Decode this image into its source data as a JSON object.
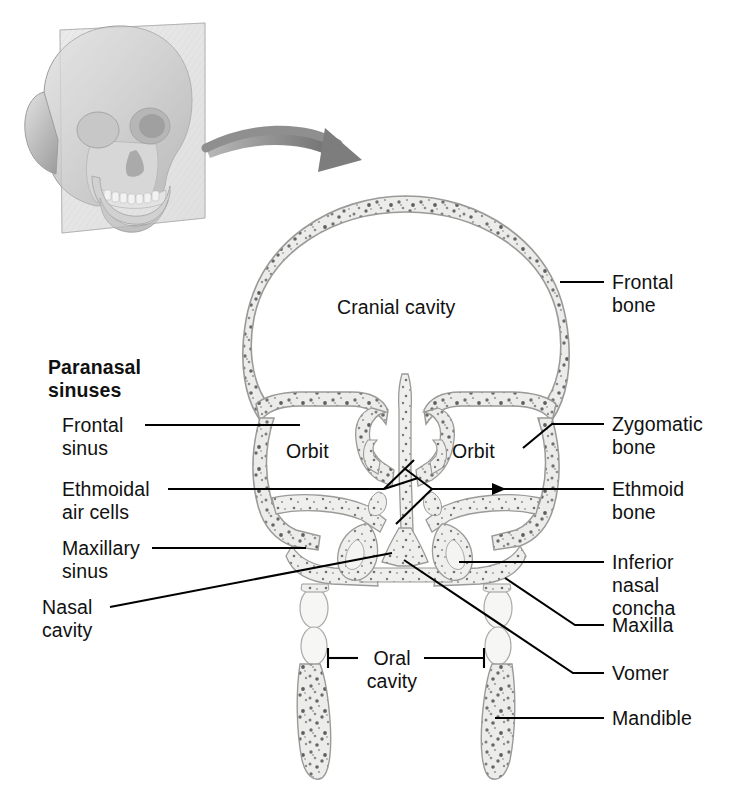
{
  "figure": {
    "type": "anatomical-illustration",
    "orientation": "anterior view of coronal section"
  },
  "inset": {
    "name": "skull-3d-inset",
    "description": "Three-quarter view of a human skull with a transparent coronal sectioning plane",
    "plane_label": "",
    "arrow": "curved-arrow pointing from inset to main section"
  },
  "left_labels": {
    "group_heading": "Paranasal\nsinuses",
    "items": [
      {
        "id": "frontal-sinus",
        "text": "Frontal\nsinus",
        "indent": true
      },
      {
        "id": "ethmoidal-air-cells",
        "text": "Ethmoidal\nair cells",
        "indent": true
      },
      {
        "id": "maxillary-sinus",
        "text": "Maxillary\nsinus",
        "indent": true
      },
      {
        "id": "nasal-cavity",
        "text": "Nasal\ncavity",
        "indent": false
      }
    ]
  },
  "right_labels": {
    "items": [
      {
        "id": "frontal-bone",
        "text": "Frontal\nbone"
      },
      {
        "id": "zygomatic-bone",
        "text": "Zygomatic\nbone"
      },
      {
        "id": "ethmoid-bone",
        "text": "Ethmoid\nbone"
      },
      {
        "id": "inferior-nasal-concha",
        "text": "Inferior\nnasal\nconcha"
      },
      {
        "id": "maxilla",
        "text": "Maxilla"
      },
      {
        "id": "vomer",
        "text": "Vomer"
      },
      {
        "id": "mandible",
        "text": "Mandible"
      }
    ]
  },
  "interior_labels": {
    "items": [
      {
        "id": "cranial-cavity",
        "text": "Cranial cavity"
      },
      {
        "id": "orbit-left",
        "text": "Orbit"
      },
      {
        "id": "orbit-right",
        "text": "Orbit"
      },
      {
        "id": "oral-cavity",
        "text": "Oral\ncavity"
      }
    ]
  },
  "colors": {
    "background": "#ffffff",
    "text": "#111111",
    "leader_line": "#000000",
    "bone_fill": "#ececea",
    "bone_outline": "#9a9a98",
    "bone_speckle_dark": "#6d6d6d",
    "bone_speckle_mid": "#9b9b9b",
    "cavity": "#ffffff",
    "arrow": "#8a8a8a",
    "inset_skull": "#cfcfcf",
    "inset_plane": "#e3e3e3",
    "tooth": "#f4f4f2"
  }
}
